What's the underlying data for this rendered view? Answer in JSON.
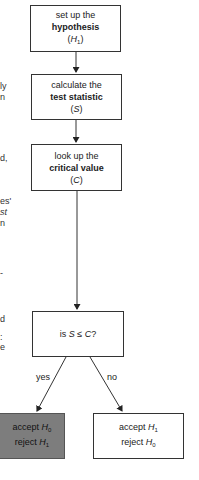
{
  "diagram": {
    "type": "flowchart",
    "nodes": [
      {
        "id": "hypothesis",
        "line1": "set up the",
        "bold": "hypothesis",
        "symbol": "H",
        "sub": "1"
      },
      {
        "id": "statistic",
        "line1": "calculate the",
        "bold": "test statistic",
        "symbol": "S",
        "sub": ""
      },
      {
        "id": "critical",
        "line1": "look up the",
        "bold": "critical value",
        "symbol": "C",
        "sub": ""
      },
      {
        "id": "decision",
        "prefix": "is ",
        "expr": "S ≤ C",
        "suffix": "?"
      },
      {
        "id": "accept-null",
        "accept_word": "accept ",
        "accept_sym": "H",
        "accept_sub": "0",
        "reject_word": "reject ",
        "reject_sym": "H",
        "reject_sub": "1",
        "fill": "#7d7d7d"
      },
      {
        "id": "accept-alt",
        "accept_word": "accept ",
        "accept_sym": "H",
        "accept_sub": "1",
        "reject_word": "reject ",
        "reject_sym": "H",
        "reject_sub": "0",
        "fill": "#ffffff"
      }
    ],
    "edges": [
      {
        "from": "hypothesis",
        "to": "statistic",
        "label": ""
      },
      {
        "from": "statistic",
        "to": "critical",
        "label": ""
      },
      {
        "from": "critical",
        "to": "decision",
        "label": ""
      },
      {
        "from": "decision",
        "to": "accept-null",
        "label": "yes"
      },
      {
        "from": "decision",
        "to": "accept-alt",
        "label": "no"
      }
    ],
    "margin_fragments": [
      "ly",
      "n",
      "d,",
      "es'",
      "st",
      "n",
      "-",
      "d",
      ":",
      "e"
    ]
  }
}
